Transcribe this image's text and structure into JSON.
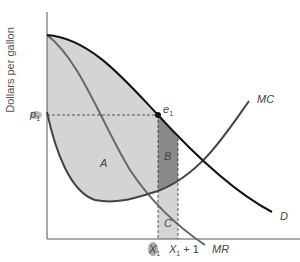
{
  "figure": {
    "ylabel": "Dollars per gallon",
    "price_label": "p",
    "price_sub": "1",
    "point_label": "e",
    "point_sub": "1",
    "x1_label": "X",
    "x1_sub": "1",
    "x1plus_label": "X",
    "x1plus_sub": "1",
    "x1plus_suffix": " + 1",
    "curves": {
      "mc": "MC",
      "mr": "MR",
      "d": "D"
    },
    "areas": {
      "a": "A",
      "b": "B",
      "c": "C"
    },
    "colors": {
      "area_light": "#d4d4d4",
      "area_dark": "#8a8a8a",
      "curve_dark": "#111111",
      "curve_gray": "#666666",
      "axis": "#555555"
    }
  }
}
